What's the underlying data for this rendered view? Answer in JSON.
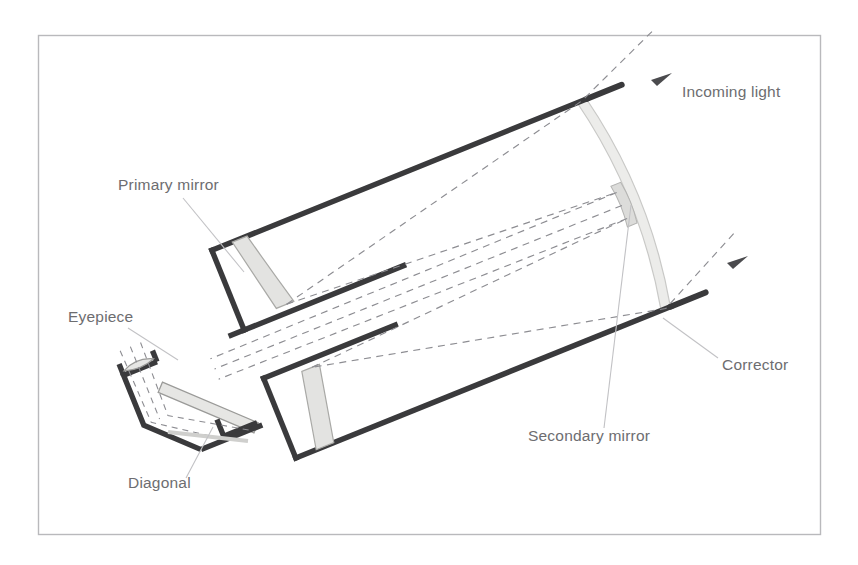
{
  "figure": {
    "frame": {
      "x": 38,
      "y": 35,
      "width": 783,
      "height": 500,
      "border_color": "#b9b9bc",
      "background": "#ffffff"
    },
    "colors": {
      "tube_outline": "#3a3a3c",
      "mirror_fill": "#e3e3e1",
      "mirror_edge": "#a9a9a6",
      "corrector_fill": "#ececea",
      "corrector_edge": "#c6c6c4",
      "ray": "#8d8d92",
      "leader": "#c2c2c5",
      "label_text": "#6d6d70"
    }
  },
  "labels": [
    {
      "id": "primary-mirror",
      "text": "Primary mirror",
      "x": 118,
      "y": 190,
      "anchor": "start"
    },
    {
      "id": "incoming-light",
      "text": "Incoming light",
      "x": 682,
      "y": 97,
      "anchor": "start"
    },
    {
      "id": "eyepiece",
      "text": "Eyepiece",
      "x": 68,
      "y": 322,
      "anchor": "start"
    },
    {
      "id": "corrector",
      "text": "Corrector",
      "x": 722,
      "y": 370,
      "anchor": "start"
    },
    {
      "id": "secondary-mirror",
      "text": "Secondary mirror",
      "x": 528,
      "y": 441,
      "anchor": "start"
    },
    {
      "id": "diagonal",
      "text": "Diagonal",
      "x": 128,
      "y": 488,
      "anchor": "start"
    }
  ],
  "components": {
    "tube": {
      "name": "telescope-tube",
      "orientation_deg": -22,
      "outline_width_px": 5
    },
    "primary_mirror": {
      "name": "primary-mirror",
      "count": 2,
      "description": "two curved shaded strips near the lower-left end of the tube"
    },
    "corrector_plate": {
      "name": "corrector-plate",
      "description": "curved light-grey plate spanning the upper-right aperture of the tube"
    },
    "secondary_mirror": {
      "name": "secondary-mirror",
      "description": "small reflective spot at the centre of the corrector plate"
    },
    "diagonal": {
      "name": "diagonal-mirror",
      "description": "45 degree flat mirror in the eyepiece housing at the lower left"
    },
    "eyepiece": {
      "name": "eyepiece-barrel",
      "description": "short barrel with lens element projecting up-left from the diagonal housing"
    }
  },
  "rays": {
    "name": "light-ray-paths",
    "style": "dashed",
    "arrow_count": 2,
    "description": "Parallel incoming rays enter through the corrector, reflect off the primary mirror, return to the secondary mirror, pass back through the primary baffle and reflect off the diagonal into the eyepiece."
  }
}
